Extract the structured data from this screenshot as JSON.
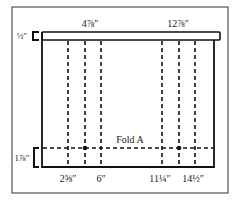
{
  "diagram": {
    "top_labels": [
      {
        "text": "4⅞″",
        "x": 90
      },
      {
        "text": "12⅞″",
        "x": 178
      }
    ],
    "bottom_labels": [
      {
        "text": "2⅝″",
        "x": 68
      },
      {
        "text": "6″",
        "x": 101
      },
      {
        "text": "11¼″",
        "x": 160
      },
      {
        "text": "14½″",
        "x": 193
      }
    ],
    "left_labels": {
      "top_band": "½″",
      "bottom_band": "1⅞″"
    },
    "fold_label": "Fold A",
    "colors": {
      "line": "#111111",
      "frame": "#333333",
      "background": "#ffffff"
    }
  }
}
